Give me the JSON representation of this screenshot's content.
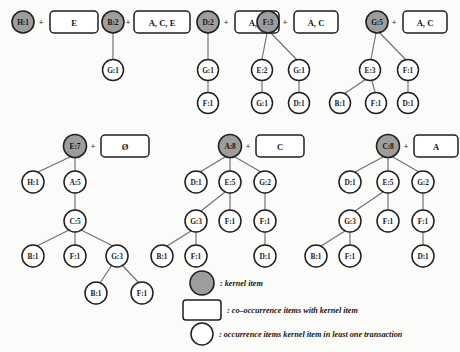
{
  "figure": {
    "type": "diagram",
    "subtype": "conditional-pattern-trees",
    "background_color": "#fbfbf9",
    "kernel_fill": "#9d9d9d",
    "node_fill": "#ffffff",
    "stroke_color": "#1f1f1f",
    "edge_color": "#6f6f6f",
    "plus_symbol": "+"
  },
  "trees": [
    {
      "id": "tree-h",
      "kernel": {
        "label": "H:1",
        "x": 23,
        "y": 22,
        "r": 11
      },
      "box": {
        "label": "E",
        "x": 50,
        "y": 11,
        "w": 48,
        "h": 22
      },
      "plus": {
        "x": 41,
        "y": 22
      },
      "nodes": [],
      "edges": []
    },
    {
      "id": "tree-b",
      "kernel": {
        "label": "B:2",
        "x": 113,
        "y": 22,
        "r": 11
      },
      "box": {
        "label": "A, C, E",
        "x": 134,
        "y": 11,
        "w": 56,
        "h": 22
      },
      "plus": {
        "x": 128,
        "y": 22
      },
      "nodes": [
        {
          "label": "G:1",
          "x": 113,
          "y": 70,
          "r": 10.5
        }
      ],
      "edges": [
        {
          "x1": 113,
          "y1": 33,
          "x2": 113,
          "y2": 59
        }
      ]
    },
    {
      "id": "tree-d",
      "kernel": {
        "label": "D:2",
        "x": 208,
        "y": 22,
        "r": 11
      },
      "box": {
        "label": "A, C",
        "x": 235,
        "y": 11,
        "w": 44,
        "h": 22
      },
      "plus": {
        "x": 226,
        "y": 22
      },
      "nodes": [
        {
          "label": "G:1",
          "x": 208,
          "y": 70,
          "r": 10.5
        },
        {
          "label": "F:1",
          "x": 208,
          "y": 103,
          "r": 10.5
        }
      ],
      "edges": [
        {
          "x1": 208,
          "y1": 33,
          "x2": 208,
          "y2": 59
        },
        {
          "x1": 208,
          "y1": 81,
          "x2": 208,
          "y2": 92
        }
      ]
    },
    {
      "id": "tree-f",
      "kernel": {
        "label": "F:3",
        "x": 268,
        "y": 22,
        "r": 11
      },
      "box": {
        "label": "A, C",
        "x": 294,
        "y": 11,
        "w": 44,
        "h": 22
      },
      "plus": {
        "x": 285,
        "y": 22
      },
      "nodes": [
        {
          "label": "E:2",
          "x": 262,
          "y": 70,
          "r": 10.5
        },
        {
          "label": "G:1",
          "x": 299,
          "y": 70,
          "r": 10.5
        },
        {
          "label": "G:1",
          "x": 262,
          "y": 103,
          "r": 10.5
        },
        {
          "label": "D:1",
          "x": 299,
          "y": 103,
          "r": 10.5
        }
      ],
      "edges": [
        {
          "x1": 267,
          "y1": 33,
          "x2": 262,
          "y2": 59
        },
        {
          "x1": 270,
          "y1": 32,
          "x2": 297,
          "y2": 60
        },
        {
          "x1": 262,
          "y1": 81,
          "x2": 262,
          "y2": 92
        },
        {
          "x1": 299,
          "y1": 81,
          "x2": 299,
          "y2": 92
        }
      ]
    },
    {
      "id": "tree-g",
      "kernel": {
        "label": "G:5",
        "x": 377,
        "y": 22,
        "r": 11
      },
      "box": {
        "label": "A, C",
        "x": 403,
        "y": 11,
        "w": 44,
        "h": 22
      },
      "plus": {
        "x": 394,
        "y": 22
      },
      "nodes": [
        {
          "label": "E:3",
          "x": 370,
          "y": 70,
          "r": 10.5
        },
        {
          "label": "F:1",
          "x": 408,
          "y": 70,
          "r": 10.5
        },
        {
          "label": "B:1",
          "x": 340,
          "y": 103,
          "r": 10.5
        },
        {
          "label": "F:1",
          "x": 376,
          "y": 103,
          "r": 10.5
        },
        {
          "label": "D:1",
          "x": 408,
          "y": 103,
          "r": 10.5
        }
      ],
      "edges": [
        {
          "x1": 376,
          "y1": 33,
          "x2": 371,
          "y2": 59
        },
        {
          "x1": 379,
          "y1": 32,
          "x2": 406,
          "y2": 60
        },
        {
          "x1": 366,
          "y1": 79,
          "x2": 344,
          "y2": 94
        },
        {
          "x1": 372,
          "y1": 81,
          "x2": 375,
          "y2": 92
        },
        {
          "x1": 408,
          "y1": 81,
          "x2": 408,
          "y2": 92
        }
      ]
    },
    {
      "id": "tree-e",
      "kernel": {
        "label": "E:7",
        "x": 75,
        "y": 146,
        "r": 11.5
      },
      "box": {
        "label": "Ø",
        "x": 101,
        "y": 135,
        "w": 48,
        "h": 22
      },
      "plus": {
        "x": 93,
        "y": 146
      },
      "nodes": [
        {
          "label": "H:1",
          "x": 33,
          "y": 182,
          "r": 11
        },
        {
          "label": "A:5",
          "x": 75,
          "y": 182,
          "r": 11
        },
        {
          "label": "C:5",
          "x": 75,
          "y": 221,
          "r": 11
        },
        {
          "label": "B:1",
          "x": 33,
          "y": 256,
          "r": 11
        },
        {
          "label": "F:1",
          "x": 75,
          "y": 256,
          "r": 11
        },
        {
          "label": "G:3",
          "x": 117,
          "y": 256,
          "r": 11
        },
        {
          "label": "B:1",
          "x": 96,
          "y": 293,
          "r": 11
        },
        {
          "label": "F:1",
          "x": 142,
          "y": 293,
          "r": 11
        }
      ],
      "edges": [
        {
          "x1": 70,
          "y1": 157,
          "x2": 38,
          "y2": 172
        },
        {
          "x1": 75,
          "y1": 158,
          "x2": 75,
          "y2": 171
        },
        {
          "x1": 75,
          "y1": 193,
          "x2": 75,
          "y2": 210
        },
        {
          "x1": 69,
          "y1": 230,
          "x2": 37,
          "y2": 246
        },
        {
          "x1": 75,
          "y1": 232,
          "x2": 75,
          "y2": 245
        },
        {
          "x1": 81,
          "y1": 230,
          "x2": 113,
          "y2": 246
        },
        {
          "x1": 112,
          "y1": 265,
          "x2": 100,
          "y2": 283
        },
        {
          "x1": 122,
          "y1": 265,
          "x2": 139,
          "y2": 283
        }
      ]
    },
    {
      "id": "tree-a",
      "kernel": {
        "label": "A:8",
        "x": 230,
        "y": 146,
        "r": 11.5
      },
      "box": {
        "label": "C",
        "x": 256,
        "y": 135,
        "w": 48,
        "h": 22
      },
      "plus": {
        "x": 248,
        "y": 146
      },
      "nodes": [
        {
          "label": "D:1",
          "x": 196,
          "y": 182,
          "r": 11
        },
        {
          "label": "E:5",
          "x": 230,
          "y": 182,
          "r": 11
        },
        {
          "label": "G:2",
          "x": 265,
          "y": 182,
          "r": 11
        },
        {
          "label": "G:3",
          "x": 196,
          "y": 221,
          "r": 11
        },
        {
          "label": "F:1",
          "x": 230,
          "y": 221,
          "r": 11
        },
        {
          "label": "F:1",
          "x": 265,
          "y": 221,
          "r": 11
        },
        {
          "label": "B:1",
          "x": 162,
          "y": 256,
          "r": 11
        },
        {
          "label": "F:1",
          "x": 196,
          "y": 256,
          "r": 11
        },
        {
          "label": "D:1",
          "x": 265,
          "y": 256,
          "r": 11
        }
      ],
      "edges": [
        {
          "x1": 225,
          "y1": 157,
          "x2": 200,
          "y2": 172
        },
        {
          "x1": 230,
          "y1": 158,
          "x2": 230,
          "y2": 171
        },
        {
          "x1": 235,
          "y1": 157,
          "x2": 261,
          "y2": 172
        },
        {
          "x1": 225,
          "y1": 192,
          "x2": 201,
          "y2": 211
        },
        {
          "x1": 230,
          "y1": 193,
          "x2": 230,
          "y2": 210
        },
        {
          "x1": 265,
          "y1": 193,
          "x2": 265,
          "y2": 210
        },
        {
          "x1": 191,
          "y1": 231,
          "x2": 167,
          "y2": 246
        },
        {
          "x1": 196,
          "y1": 232,
          "x2": 196,
          "y2": 245
        },
        {
          "x1": 265,
          "y1": 232,
          "x2": 265,
          "y2": 245
        }
      ]
    },
    {
      "id": "tree-c",
      "kernel": {
        "label": "C:8",
        "x": 388,
        "y": 146,
        "r": 11.5
      },
      "box": {
        "label": "A",
        "x": 414,
        "y": 135,
        "w": 44,
        "h": 22
      },
      "plus": {
        "x": 406,
        "y": 146
      },
      "nodes": [
        {
          "label": "D:1",
          "x": 350,
          "y": 182,
          "r": 11
        },
        {
          "label": "E:5",
          "x": 388,
          "y": 182,
          "r": 11
        },
        {
          "label": "G:2",
          "x": 423,
          "y": 182,
          "r": 11
        },
        {
          "label": "G:3",
          "x": 350,
          "y": 221,
          "r": 11
        },
        {
          "label": "F:1",
          "x": 388,
          "y": 221,
          "r": 11
        },
        {
          "label": "F:1",
          "x": 423,
          "y": 221,
          "r": 11
        },
        {
          "label": "B:1",
          "x": 316,
          "y": 256,
          "r": 11
        },
        {
          "label": "F:1",
          "x": 350,
          "y": 256,
          "r": 11
        },
        {
          "label": "D:1",
          "x": 423,
          "y": 256,
          "r": 11
        }
      ],
      "edges": [
        {
          "x1": 383,
          "y1": 157,
          "x2": 355,
          "y2": 172
        },
        {
          "x1": 388,
          "y1": 158,
          "x2": 388,
          "y2": 171
        },
        {
          "x1": 393,
          "y1": 157,
          "x2": 419,
          "y2": 172
        },
        {
          "x1": 383,
          "y1": 192,
          "x2": 355,
          "y2": 211
        },
        {
          "x1": 388,
          "y1": 193,
          "x2": 388,
          "y2": 210
        },
        {
          "x1": 423,
          "y1": 193,
          "x2": 423,
          "y2": 210
        },
        {
          "x1": 345,
          "y1": 231,
          "x2": 321,
          "y2": 246
        },
        {
          "x1": 350,
          "y1": 232,
          "x2": 350,
          "y2": 245
        },
        {
          "x1": 423,
          "y1": 232,
          "x2": 423,
          "y2": 245
        }
      ]
    }
  ],
  "legend": {
    "items": [
      {
        "shape": "filled-circle",
        "text": ": kernel item",
        "x": 202,
        "y": 283,
        "r": 12
      },
      {
        "shape": "rounded-rect",
        "text": ": co–occurrence items with kernel item",
        "x": 202,
        "y": 310,
        "w": 38,
        "h": 20
      },
      {
        "shape": "open-circle",
        "text": ": occurrence items kernel item in least one transaction",
        "x": 202,
        "y": 334,
        "r": 11
      }
    ]
  }
}
